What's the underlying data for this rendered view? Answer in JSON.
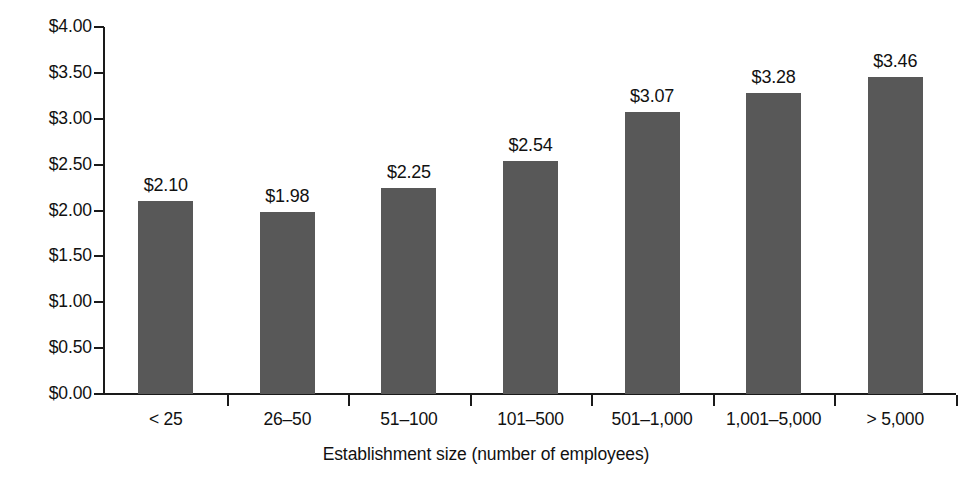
{
  "chart_data": {
    "type": "bar",
    "title": "",
    "subtitle": "",
    "xlabel": "Establishment size (number of employees)",
    "ylabel": "",
    "categories": [
      "< 25",
      "26–50",
      "51–100",
      "101–500",
      "501–1,000",
      "1,001–5,000",
      "> 5,000"
    ],
    "values": [
      2.1,
      1.98,
      2.25,
      2.54,
      3.07,
      3.28,
      3.46
    ],
    "value_labels": [
      "$2.10",
      "$1.98",
      "$2.25",
      "$2.54",
      "$3.07",
      "$3.28",
      "$3.46"
    ],
    "ylim": [
      0,
      4
    ],
    "ytick_values": [
      0,
      0.5,
      1.0,
      1.5,
      2.0,
      2.5,
      3.0,
      3.5,
      4.0
    ],
    "ytick_labels": [
      "$0.00",
      "$0.50",
      "$1.00",
      "$1.50",
      "$2.00",
      "$2.50",
      "$3.00",
      "$3.50",
      "$4.00"
    ],
    "grid": false,
    "legend": false,
    "legend_position": "none",
    "bar_color": "#585858",
    "axis_color": "#1a1a1a",
    "background_color": "#ffffff",
    "text_color": "#111111",
    "value_label_position": "above-bar",
    "ytick_direction": "outward",
    "xtick_direction": "outward-between-categories"
  }
}
